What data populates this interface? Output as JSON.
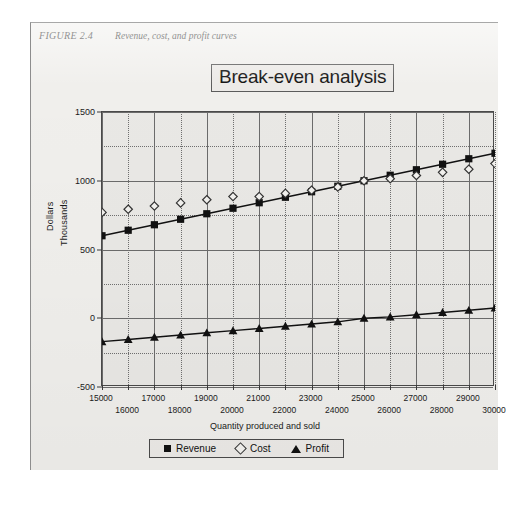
{
  "figure": {
    "number": "FIGURE 2.4",
    "caption": "Revenue, cost, and profit curves"
  },
  "chart_data": {
    "type": "line",
    "title": "Break-even analysis",
    "xlabel": "Quantity produced and sold",
    "ylabel": "Dollars",
    "ylabel2": "Thousands",
    "grid": true,
    "legend_position": "bottom",
    "xlim": [
      15000,
      30000
    ],
    "ylim": [
      -500,
      1500
    ],
    "yticks": [
      -500,
      0,
      500,
      1000,
      1500
    ],
    "ytick_labels": [
      "-500",
      "0",
      "500",
      "1000",
      "1500"
    ],
    "y_minor_step": 250,
    "categories": [
      15000,
      16000,
      17000,
      18000,
      19000,
      20000,
      21000,
      22000,
      23000,
      24000,
      25000,
      26000,
      27000,
      28000,
      29000,
      30000
    ],
    "xtick_labels": [
      "15000",
      "16000",
      "17000",
      "18000",
      "19000",
      "20000",
      "21000",
      "22000",
      "23000",
      "24000",
      "25000",
      "26000",
      "27000",
      "28000",
      "29000",
      "30000"
    ],
    "series": [
      {
        "name": "Revenue",
        "marker": "filled-square",
        "line": true,
        "color": "#111111",
        "values": [
          600,
          640,
          680,
          720,
          760,
          800,
          840,
          880,
          920,
          960,
          1000,
          1040,
          1080,
          1120,
          1160,
          1200
        ]
      },
      {
        "name": "Cost",
        "marker": "open-diamond",
        "line": false,
        "color": "#333333",
        "values": [
          770,
          793,
          816,
          839,
          862,
          885,
          885,
          908,
          931,
          954,
          1000,
          1015,
          1038,
          1061,
          1084,
          1125
        ]
      },
      {
        "name": "Profit",
        "marker": "filled-triangle",
        "line": true,
        "color": "#111111",
        "values": [
          -170,
          -154,
          -138,
          -122,
          -106,
          -90,
          -74,
          -58,
          -42,
          -26,
          0,
          10,
          26,
          42,
          58,
          75
        ]
      }
    ],
    "annotations": []
  }
}
